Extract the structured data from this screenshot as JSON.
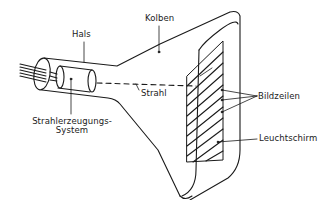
{
  "diagram": {
    "colors": {
      "line": "#1a1a1a",
      "background": "#ffffff"
    },
    "labels": {
      "hals": "Hals",
      "kolben": "Kolben",
      "strahl": "Strahl",
      "bildzeilen": "Bildzeilen",
      "strahlerzeugung_line1": "Strahlerzeugungs-",
      "strahlerzeugung_line2": "System",
      "leuchtschirm": "Leuchtschirm"
    },
    "scan_line_count": 11
  }
}
